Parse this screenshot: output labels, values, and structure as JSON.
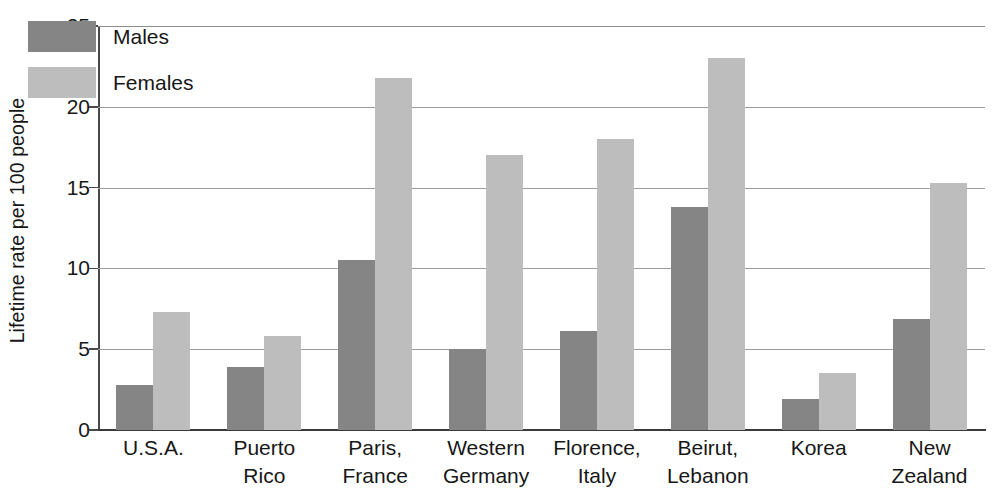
{
  "chart_data": {
    "type": "bar",
    "title": "",
    "subtitle": "",
    "xlabel": "",
    "ylabel": "Lifetime rate per 100 people",
    "ylim": [
      0,
      25
    ],
    "yticks": [
      0,
      5,
      10,
      15,
      20,
      25
    ],
    "ytick_labels": [
      "0",
      "5",
      "10",
      "15",
      "20",
      "25"
    ],
    "grid": true,
    "legend_position": "top-left",
    "categories": [
      "U.S.A.",
      "Puerto Rico",
      "Paris, France",
      "Western Germany",
      "Florence, Italy",
      "Beirut, Lebanon",
      "Korea",
      "New Zealand"
    ],
    "category_lines": [
      [
        "U.S.A."
      ],
      [
        "Puerto",
        "Rico"
      ],
      [
        "Paris,",
        "France"
      ],
      [
        "Western",
        "Germany"
      ],
      [
        "Florence,",
        "Italy"
      ],
      [
        "Beirut,",
        "Lebanon"
      ],
      [
        "Korea"
      ],
      [
        "New",
        "Zealand"
      ]
    ],
    "series": [
      {
        "name": "Males",
        "color": "#858585",
        "values": [
          2.8,
          3.9,
          10.5,
          5.0,
          6.1,
          13.8,
          1.9,
          6.9
        ]
      },
      {
        "name": "Females",
        "color": "#bdbdbd",
        "values": [
          7.3,
          5.8,
          21.8,
          17.0,
          18.0,
          23.0,
          3.5,
          15.3
        ]
      }
    ]
  },
  "legend": {
    "items": [
      {
        "label": "Males",
        "color": "#858585"
      },
      {
        "label": "Females",
        "color": "#bdbdbd"
      }
    ]
  },
  "axis": {
    "y_title": "Lifetime rate per 100 people"
  },
  "colors": {
    "males": "#858585",
    "females": "#bdbdbd",
    "gridline": "#9b9b9b",
    "axis": "#3a3a3a",
    "text": "#171717",
    "background": "#ffffff"
  }
}
